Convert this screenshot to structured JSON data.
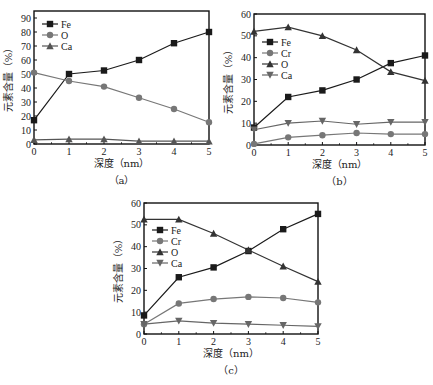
{
  "chart_data": [
    {
      "id": "a",
      "type": "line",
      "caption": "（a）",
      "xlabel": "深度（nm）",
      "ylabel": "元素含量（%）",
      "x": [
        0,
        1,
        2,
        3,
        4,
        5
      ],
      "xlim": [
        0,
        5
      ],
      "ylim": [
        0,
        95
      ],
      "xticks": [
        0,
        1,
        2,
        3,
        4,
        5
      ],
      "yticks": [
        0,
        10,
        20,
        30,
        40,
        50,
        60,
        70,
        80,
        90
      ],
      "legend_position": "top-left",
      "series": [
        {
          "name": "Fe",
          "marker": "square",
          "color": "#1a1a1a",
          "values": [
            17,
            50,
            52.5,
            60,
            72,
            80
          ]
        },
        {
          "name": "O",
          "marker": "circle",
          "color": "#777777",
          "values": [
            51,
            45,
            41,
            33,
            25,
            15.5
          ]
        },
        {
          "name": "Ca",
          "marker": "triangle-up",
          "color": "#555555",
          "values": [
            3,
            3.5,
            3.5,
            2,
            2,
            2
          ]
        }
      ]
    },
    {
      "id": "b",
      "type": "line",
      "caption": "（b）",
      "xlabel": "深度（nm）",
      "ylabel": "元素含量（%）",
      "x": [
        0,
        1,
        2,
        3,
        4,
        5
      ],
      "xlim": [
        0,
        5
      ],
      "ylim": [
        0,
        60
      ],
      "xticks": [
        0,
        1,
        2,
        3,
        4,
        5
      ],
      "yticks": [
        0,
        10,
        20,
        30,
        40,
        50,
        60
      ],
      "legend_position": "upper-left",
      "series": [
        {
          "name": "Fe",
          "marker": "square",
          "color": "#1a1a1a",
          "values": [
            8,
            22,
            25,
            30,
            37.5,
            41
          ]
        },
        {
          "name": "Cr",
          "marker": "circle",
          "color": "#777777",
          "values": [
            0.5,
            3.5,
            4.5,
            5.5,
            5,
            5
          ]
        },
        {
          "name": "O",
          "marker": "triangle-up",
          "color": "#333333",
          "values": [
            52,
            54,
            50,
            43.5,
            33.5,
            29.5
          ]
        },
        {
          "name": "Ca",
          "marker": "triangle-down",
          "color": "#666666",
          "values": [
            7,
            10,
            11,
            9.5,
            10.5,
            10.5
          ]
        }
      ]
    },
    {
      "id": "c",
      "type": "line",
      "caption": "（c）",
      "xlabel": "深度（nm）",
      "ylabel": "元素含量（%）",
      "x": [
        0,
        1,
        2,
        3,
        4,
        5
      ],
      "xlim": [
        0,
        5
      ],
      "ylim": [
        0,
        60
      ],
      "xticks": [
        0,
        1,
        2,
        3,
        4,
        5
      ],
      "yticks": [
        0,
        10,
        20,
        30,
        40,
        50,
        60
      ],
      "legend_position": "upper-left",
      "series": [
        {
          "name": "Fe",
          "marker": "square",
          "color": "#1a1a1a",
          "values": [
            8.5,
            26,
            30.5,
            38,
            48,
            55
          ]
        },
        {
          "name": "Cr",
          "marker": "circle",
          "color": "#777777",
          "values": [
            4.5,
            14,
            16,
            17,
            16.5,
            14.5
          ]
        },
        {
          "name": "O",
          "marker": "triangle-up",
          "color": "#333333",
          "values": [
            52.5,
            52.5,
            46,
            38.5,
            31,
            24
          ]
        },
        {
          "name": "Ca",
          "marker": "triangle-down",
          "color": "#666666",
          "values": [
            4.5,
            6,
            5,
            4.5,
            4,
            3.5
          ]
        }
      ]
    }
  ]
}
